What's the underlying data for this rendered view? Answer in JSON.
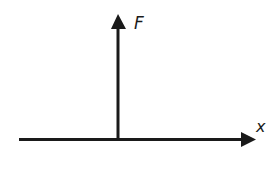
{
  "diagram": {
    "type": "force-vs-displacement-axes",
    "stroke_color": "#1a1a1a",
    "background_color": "#ffffff",
    "vertical_axis": {
      "label": "F",
      "direction": "up"
    },
    "horizontal_axis": {
      "label": "x",
      "direction": "right"
    }
  }
}
